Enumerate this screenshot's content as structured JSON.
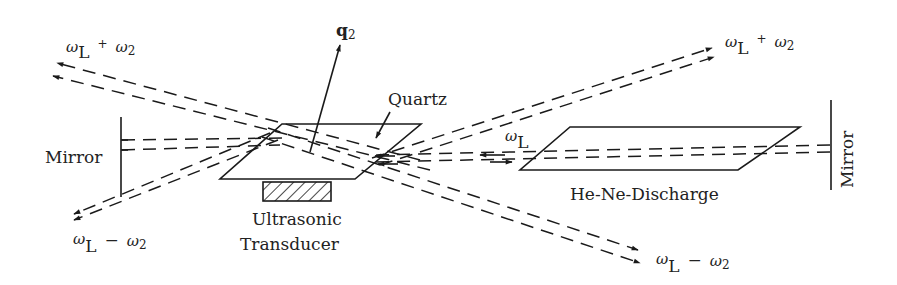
{
  "diagram": {
    "colors": {
      "ink": "#1a1a1a",
      "background": "#ffffff"
    },
    "components": {
      "quartz": {
        "label": "Quartz"
      },
      "transducer": {
        "label_line1": "Ultrasonic",
        "label_line2": "Transducer"
      },
      "discharge": {
        "label": "He-Ne-Discharge"
      },
      "mirror_left": {
        "label": "Mirror"
      },
      "mirror_right": {
        "label": "Mirror"
      },
      "wavevector": {
        "label": "q",
        "subscript": "2"
      }
    },
    "beams": {
      "upper_left": {
        "omega": "ω",
        "sub1": "L",
        "op": "+",
        "omega2": "ω",
        "sub2": "2"
      },
      "lower_left": {
        "omega": "ω",
        "sub1": "L",
        "op": "−",
        "omega2": "ω",
        "sub2": "2"
      },
      "upper_right": {
        "omega": "ω",
        "sub1": "L",
        "op": "+",
        "omega2": "ω",
        "sub2": "2"
      },
      "lower_right": {
        "omega": "ω",
        "sub1": "L",
        "op": "−",
        "omega2": "ω",
        "sub2": "2"
      },
      "laser": {
        "omega": "ω",
        "sub1": "L"
      }
    }
  }
}
